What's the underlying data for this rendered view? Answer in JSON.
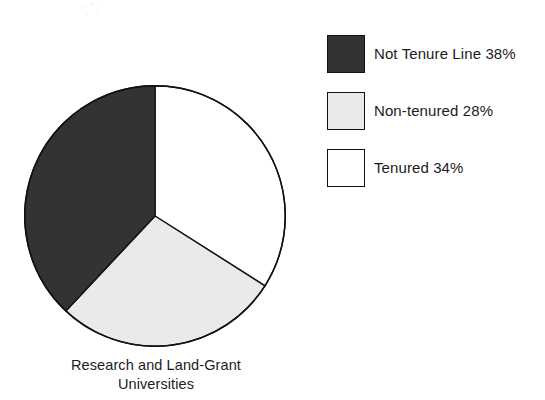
{
  "chart_data": {
    "type": "pie",
    "title": "",
    "caption_lines": [
      "Research and Land-Grant",
      "Universities"
    ],
    "categories": [
      "Not Tenure Line",
      "Non-tenured",
      "Tenured"
    ],
    "values": [
      38,
      28,
      34
    ],
    "unit": "%",
    "value_labels": [
      "38%",
      "28%",
      "34%"
    ],
    "legend_entries": [
      {
        "label": "Not Tenure Line 38%",
        "name": "Not Tenure Line",
        "value": 38,
        "color": "#333333"
      },
      {
        "label": "Non-tenured 28%",
        "name": "Non-tenured",
        "value": 28,
        "color": "#eaeaea"
      },
      {
        "label": "Tenured 34%",
        "name": "Tenured",
        "value": 34,
        "color": "#ffffff"
      }
    ],
    "legend_position": "right",
    "start_angle_deg": 0,
    "direction": "clockwise",
    "grid": false,
    "slices": [
      {
        "name": "Tenured",
        "value": 34,
        "start_deg": 0.0,
        "end_deg": 122.4,
        "fill": "#ffffff",
        "stroke": "#111111"
      },
      {
        "name": "Non-tenured",
        "value": 28,
        "start_deg": 122.4,
        "end_deg": 223.2,
        "fill": "#eaeaea",
        "stroke": "#111111"
      },
      {
        "name": "Not Tenure Line",
        "value": 38,
        "start_deg": 223.2,
        "end_deg": 360.0,
        "fill": "#333333",
        "stroke": "#111111"
      }
    ]
  },
  "pie": {
    "caption_line_1": "Research and Land-Grant",
    "caption_line_2": "Universities"
  },
  "legend": {
    "items": [
      {
        "label": "Not Tenure Line 38%"
      },
      {
        "label": "Non-tenured 28%"
      },
      {
        "label": "Tenured 34%"
      }
    ]
  },
  "colors": {
    "slice_not_tenure_line": "#333333",
    "slice_non_tenured": "#eaeaea",
    "slice_tenured": "#ffffff",
    "outline": "#111111",
    "text": "#1c1c1c",
    "background": "#ffffff"
  }
}
